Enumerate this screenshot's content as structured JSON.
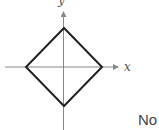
{
  "graph": {
    "x_axis_label": "x",
    "y_axis_label": "y",
    "shape": "diamond (square rotated 45°) centered at origin",
    "vertices": [
      [
        0,
        1
      ],
      [
        1,
        0
      ],
      [
        0,
        -1
      ],
      [
        -1,
        0
      ]
    ],
    "colors": {
      "axis": "#888888",
      "shape": "#222222"
    }
  },
  "answer": {
    "text": "No"
  }
}
